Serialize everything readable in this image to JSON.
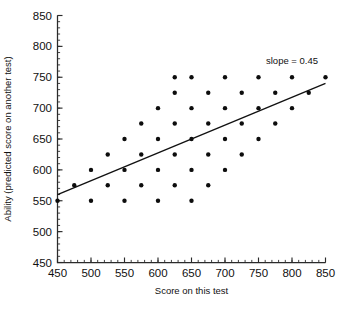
{
  "chart_data": {
    "type": "scatter",
    "title": "",
    "xlabel": "Score on this test",
    "ylabel": "Ability (predicted score on another test)",
    "xlim": [
      450,
      850
    ],
    "ylim": [
      450,
      850
    ],
    "xticks": [
      450,
      500,
      550,
      600,
      650,
      700,
      750,
      800,
      850
    ],
    "yticks": [
      450,
      500,
      550,
      600,
      650,
      700,
      750,
      800,
      850
    ],
    "xtick_labels": [
      "450",
      "500",
      "550",
      "600",
      "650",
      "700",
      "750",
      "800",
      "850"
    ],
    "ytick_labels": [
      "450",
      "500",
      "550",
      "600",
      "650",
      "700",
      "750",
      "800",
      "850"
    ],
    "minor_tick_step": 10,
    "grid": false,
    "legend": null,
    "annotations": [
      {
        "text": "slope = 0.45",
        "x": 800,
        "y": 772
      }
    ],
    "trend_line": {
      "label": "slope = 0.45",
      "slope": 0.45,
      "intercept": 357.5,
      "x_start": 450,
      "y_start": 560,
      "x_end": 850,
      "y_end": 740
    },
    "marker": {
      "shape": "circle",
      "size": 2.2,
      "color": "#0d0d0d"
    },
    "points": [
      {
        "x": 450,
        "y": 550
      },
      {
        "x": 475,
        "y": 575
      },
      {
        "x": 500,
        "y": 550
      },
      {
        "x": 500,
        "y": 600
      },
      {
        "x": 525,
        "y": 575
      },
      {
        "x": 525,
        "y": 625
      },
      {
        "x": 550,
        "y": 550
      },
      {
        "x": 550,
        "y": 600
      },
      {
        "x": 550,
        "y": 650
      },
      {
        "x": 575,
        "y": 575
      },
      {
        "x": 575,
        "y": 625
      },
      {
        "x": 575,
        "y": 675
      },
      {
        "x": 600,
        "y": 550
      },
      {
        "x": 600,
        "y": 600
      },
      {
        "x": 600,
        "y": 650
      },
      {
        "x": 600,
        "y": 700
      },
      {
        "x": 625,
        "y": 575
      },
      {
        "x": 625,
        "y": 625
      },
      {
        "x": 625,
        "y": 675
      },
      {
        "x": 625,
        "y": 725
      },
      {
        "x": 625,
        "y": 750
      },
      {
        "x": 650,
        "y": 550
      },
      {
        "x": 650,
        "y": 600
      },
      {
        "x": 650,
        "y": 650
      },
      {
        "x": 650,
        "y": 700
      },
      {
        "x": 650,
        "y": 750
      },
      {
        "x": 675,
        "y": 575
      },
      {
        "x": 675,
        "y": 625
      },
      {
        "x": 675,
        "y": 675
      },
      {
        "x": 675,
        "y": 725
      },
      {
        "x": 700,
        "y": 600
      },
      {
        "x": 700,
        "y": 650
      },
      {
        "x": 700,
        "y": 700
      },
      {
        "x": 700,
        "y": 750
      },
      {
        "x": 725,
        "y": 625
      },
      {
        "x": 725,
        "y": 675
      },
      {
        "x": 725,
        "y": 725
      },
      {
        "x": 750,
        "y": 650
      },
      {
        "x": 750,
        "y": 700
      },
      {
        "x": 750,
        "y": 750
      },
      {
        "x": 775,
        "y": 675
      },
      {
        "x": 775,
        "y": 725
      },
      {
        "x": 800,
        "y": 700
      },
      {
        "x": 800,
        "y": 750
      },
      {
        "x": 825,
        "y": 725
      },
      {
        "x": 850,
        "y": 750
      }
    ]
  }
}
